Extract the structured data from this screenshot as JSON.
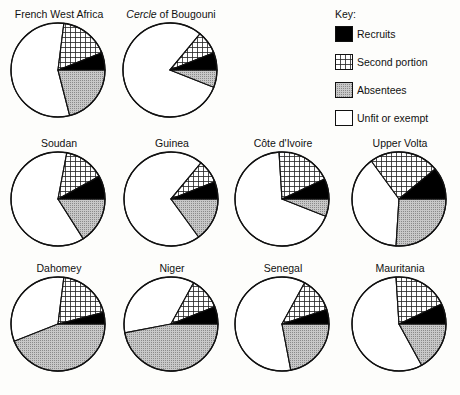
{
  "key": {
    "title": "Key:",
    "items": [
      {
        "id": "recruits",
        "label": "Recruits",
        "fill": "black"
      },
      {
        "id": "second",
        "label": "Second portion",
        "fill": "grid"
      },
      {
        "id": "absentees",
        "label": "Absentees",
        "fill": "dots"
      },
      {
        "id": "unfit",
        "label": "Unfit or exempt",
        "fill": "white"
      }
    ]
  },
  "colors": {
    "recruits": "#000000",
    "grid_line": "#222222",
    "absentees": "#b8b8b8",
    "unfit": "#ffffff",
    "outline": "#111111"
  },
  "pies": [
    {
      "name": "French West Africa",
      "italic_prefix": "",
      "x": 4,
      "y": 8
    },
    {
      "name": " of Bougouni",
      "italic_prefix": "Cercle",
      "x": 116,
      "y": 8
    },
    {
      "name": "Soudan",
      "italic_prefix": "",
      "x": 4,
      "y": 137
    },
    {
      "name": "Guinea",
      "italic_prefix": "",
      "x": 117,
      "y": 137
    },
    {
      "name": "Côte d'Ivoire",
      "italic_prefix": "",
      "x": 228,
      "y": 137
    },
    {
      "name": "Upper Volta",
      "italic_prefix": "",
      "x": 345,
      "y": 137
    },
    {
      "name": "Dahomey",
      "italic_prefix": "",
      "x": 4,
      "y": 262
    },
    {
      "name": "Niger",
      "italic_prefix": "",
      "x": 117,
      "y": 262
    },
    {
      "name": "Senegal",
      "italic_prefix": "",
      "x": 228,
      "y": 262
    },
    {
      "name": "Mauritania",
      "italic_prefix": "",
      "x": 345,
      "y": 262
    }
  ],
  "chart_data": {
    "type": "pie",
    "title": "",
    "legend": [
      "Recruits",
      "Second portion",
      "Absentees",
      "Unfit or exempt"
    ],
    "legend_position": "top-right",
    "units": "percent of men examined (estimated from slice angles)",
    "series": [
      {
        "name": "French West Africa",
        "values": {
          "Recruits": 6,
          "Second portion": 17,
          "Absentees": 21,
          "Unfit or exempt": 56
        }
      },
      {
        "name": "Cercle of Bougouni",
        "values": {
          "Recruits": 6,
          "Second portion": 8,
          "Absentees": 6,
          "Unfit or exempt": 80
        }
      },
      {
        "name": "Soudan",
        "values": {
          "Recruits": 8,
          "Second portion": 14,
          "Absentees": 16,
          "Unfit or exempt": 62
        }
      },
      {
        "name": "Guinea",
        "values": {
          "Recruits": 6,
          "Second portion": 8,
          "Absentees": 15,
          "Unfit or exempt": 71
        }
      },
      {
        "name": "Côte d'Ivoire",
        "values": {
          "Recruits": 7,
          "Second portion": 19,
          "Absentees": 6,
          "Unfit or exempt": 68
        }
      },
      {
        "name": "Upper Volta",
        "values": {
          "Recruits": 11,
          "Second portion": 24,
          "Absentees": 26,
          "Unfit or exempt": 39
        }
      },
      {
        "name": "Dahomey",
        "values": {
          "Recruits": 4,
          "Second portion": 19,
          "Absentees": 44,
          "Unfit or exempt": 33
        }
      },
      {
        "name": "Niger",
        "values": {
          "Recruits": 6,
          "Second portion": 11,
          "Absentees": 47,
          "Unfit or exempt": 36
        }
      },
      {
        "name": "Senegal",
        "values": {
          "Recruits": 5,
          "Second portion": 12,
          "Absentees": 22,
          "Unfit or exempt": 61
        }
      },
      {
        "name": "Mauritania",
        "values": {
          "Recruits": 7,
          "Second portion": 19,
          "Absentees": 17,
          "Unfit or exempt": 57
        }
      }
    ]
  }
}
